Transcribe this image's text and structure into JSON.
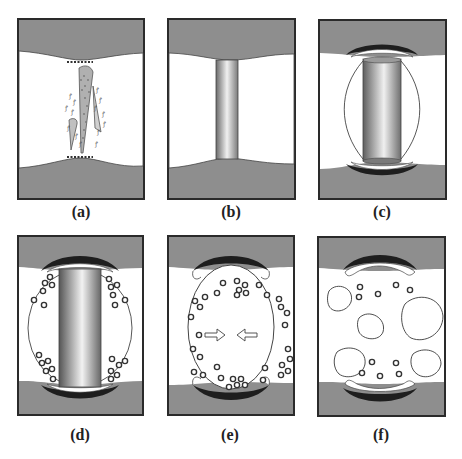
{
  "figure": {
    "colors": {
      "tissue_gray": "#8e8e8e",
      "border": "#2a2a2a",
      "white": "#ffffff",
      "dark_cap": "#1e1e1e",
      "vesicle_edge": "#3a3a3a"
    },
    "panels": [
      {
        "id": "a",
        "label": "(a)",
        "description": "Initial rupture with debris between two tissue layers"
      },
      {
        "id": "b",
        "label": "(b)",
        "description": "Cylindrical column bridging the layers"
      },
      {
        "id": "c",
        "label": "(c)",
        "description": "Column with surrounding envelope and dark caps"
      },
      {
        "id": "d",
        "label": "(d)",
        "description": "Column with particles accumulating near caps"
      },
      {
        "id": "e",
        "label": "(e)",
        "description": "Column dissolved; inward arrows and scattered particles"
      },
      {
        "id": "f",
        "label": "(f)",
        "description": "Fragmented vesicles and remaining particles"
      }
    ]
  }
}
